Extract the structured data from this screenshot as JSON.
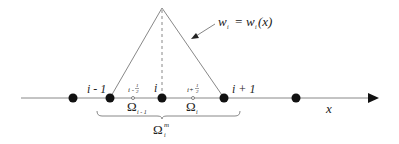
{
  "diagram": {
    "type": "finite-volume-1d-hat-function",
    "axis": {
      "label": "x"
    },
    "nodes": [
      {
        "id": "node-i-minus-2",
        "label": ""
      },
      {
        "id": "node-i-minus-1",
        "label": "i - 1"
      },
      {
        "id": "node-i",
        "label": "i"
      },
      {
        "id": "node-i-plus-1",
        "label": "i + 1"
      },
      {
        "id": "node-i-plus-2",
        "label": ""
      }
    ],
    "half_points": [
      {
        "label_main": "i -",
        "frac_num": "1",
        "frac_den": "2"
      },
      {
        "label_main": "i+",
        "frac_num": "1",
        "frac_den": "2"
      }
    ],
    "subdomains": [
      {
        "base": "Ω",
        "sub": "i - 1"
      },
      {
        "base": "Ω",
        "sub": "i"
      }
    ],
    "union_domain": {
      "base": "Ω",
      "sub": "i",
      "sup": "m"
    },
    "weight_function": {
      "lhs": "w",
      "lhs_sub": "i",
      "eq": " = ",
      "rhs": "w",
      "rhs_sub": "i",
      "rhs_arg": "(x)"
    },
    "colors": {
      "line": "#888888",
      "node": "#111111",
      "text": "#222222"
    }
  }
}
